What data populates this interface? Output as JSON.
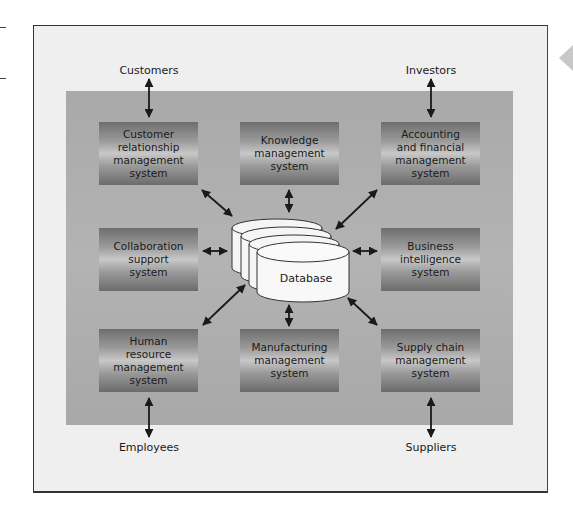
{
  "diagram": {
    "type": "hub-and-spoke",
    "center": {
      "label": "Database"
    },
    "systems": [
      {
        "id": "crm",
        "label": "Customer\nrelationship\nmanagement\nsystem",
        "external": "Customers"
      },
      {
        "id": "km",
        "label": "Knowledge\nmanagement\nsystem"
      },
      {
        "id": "afm",
        "label": "Accounting\nand financial\nmanagement\nsystem",
        "external": "Investors"
      },
      {
        "id": "collab",
        "label": "Collaboration\nsupport\nsystem"
      },
      {
        "id": "bi",
        "label": "Business\nintelligence\nsystem"
      },
      {
        "id": "hrm",
        "label": "Human\nresource\nmanagement\nsystem",
        "external": "Employees"
      },
      {
        "id": "mfg",
        "label": "Manufacturing\nmanagement\nsystem"
      },
      {
        "id": "scm",
        "label": "Supply chain\nmanagement\nsystem",
        "external": "Suppliers"
      }
    ],
    "externals": {
      "customers": "Customers",
      "investors": "Investors",
      "employees": "Employees",
      "suppliers": "Suppliers"
    }
  },
  "colors": {
    "frame_bg": "#efefef",
    "panel_bg": "#afafaf",
    "box_dark": "#6e6e6e",
    "box_light": "#c8c8c8",
    "arrow": "#1a1a1a",
    "nav_arrow": "#c8c8c8"
  }
}
